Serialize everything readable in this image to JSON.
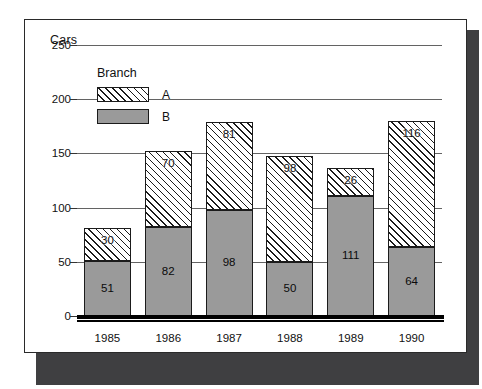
{
  "chart_data": {
    "type": "bar",
    "subtype": "stacked-bar",
    "title": "Cars",
    "xlabel": "",
    "ylabel": "Cars",
    "ylim": [
      0,
      250
    ],
    "yticks": [
      0,
      50,
      100,
      150,
      200,
      250
    ],
    "grid": true,
    "legend_title": "Branch",
    "legend_position": "inside-top-left",
    "categories": [
      "1985",
      "1986",
      "1987",
      "1988",
      "1989",
      "1990"
    ],
    "series": [
      {
        "name": "B",
        "values": [
          51,
          82,
          98,
          50,
          111,
          64
        ]
      },
      {
        "name": "A",
        "values": [
          30,
          70,
          81,
          98,
          26,
          116
        ]
      }
    ],
    "totals": [
      81,
      152,
      179,
      148,
      137,
      180
    ],
    "colors": {
      "series_b_fill": "#9a9a9a",
      "series_a_fill": "#ffffff",
      "series_a_hatch": "#1b1b1b",
      "gridline": "#636363",
      "axis": "#000000",
      "frame_border": "#2a2a2a",
      "card_shadow": "#3f3f41",
      "background": "#ffffff",
      "text": "#111111"
    }
  },
  "legend": {
    "title": "Branch",
    "items": [
      {
        "label": "A",
        "swatch": "hatch-diagonal"
      },
      {
        "label": "B",
        "swatch": "solid-gray"
      }
    ]
  },
  "axes": {
    "y_title": "Cars",
    "y_ticks": [
      "250",
      "200",
      "150",
      "100",
      "50",
      "0"
    ],
    "x_ticks": [
      "1985",
      "1986",
      "1987",
      "1988",
      "1989",
      "1990"
    ]
  },
  "bar_labels": {
    "1985": {
      "a": "30",
      "b": "51"
    },
    "1986": {
      "a": "70",
      "b": "82"
    },
    "1987": {
      "a": "81",
      "b": "98"
    },
    "1988": {
      "a": "98",
      "b": "50"
    },
    "1989": {
      "a": "26",
      "b": "111"
    },
    "1990": {
      "a": "116",
      "b": "64"
    }
  }
}
